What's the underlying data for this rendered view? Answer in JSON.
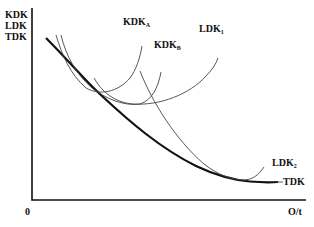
{
  "diagram": {
    "type": "cost-curves",
    "y_axis": {
      "labels": [
        "KDK",
        "LDK",
        "TDK"
      ]
    },
    "x_axis": {
      "label": "O/t",
      "origin_label": "0"
    },
    "curves": [
      {
        "id": "TDK",
        "label": "TDK",
        "sub": "",
        "style": "thick envelope"
      },
      {
        "id": "KDK_A",
        "label": "KDK",
        "sub": "A",
        "style": "thin U-curve"
      },
      {
        "id": "KDK_B",
        "label": "KDK",
        "sub": "B",
        "style": "thin U-curve"
      },
      {
        "id": "LDK_1",
        "label": "LDK",
        "sub": "1",
        "style": "thin U-curve"
      },
      {
        "id": "LDK_2",
        "label": "LDK",
        "sub": "2",
        "style": "thin U-curve"
      }
    ],
    "colors": {
      "line": "#111111",
      "thin_line": "#444444",
      "background": "#ffffff"
    }
  }
}
